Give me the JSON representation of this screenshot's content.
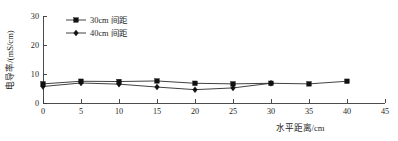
{
  "chart_data": {
    "type": "line",
    "title": "",
    "xlabel": "水平距离/cm",
    "ylabel": "电导率/(mS/cm)",
    "xlim": [
      0,
      45
    ],
    "ylim": [
      0,
      30
    ],
    "xticks": [
      0,
      5,
      10,
      15,
      20,
      25,
      30,
      35,
      40,
      45
    ],
    "yticks": [
      0,
      10,
      20,
      30
    ],
    "xtick_labels": [
      "0",
      "5",
      "10",
      "15",
      "20",
      "25",
      "30",
      "35",
      "40",
      "45"
    ],
    "ytick_labels": [
      "0",
      "10",
      "20",
      "30"
    ],
    "grid": false,
    "legend_position": "upper-left",
    "series": [
      {
        "name": "30cm 间距",
        "marker": "square",
        "color": "#111111",
        "x": [
          0,
          5,
          10,
          15,
          20,
          25,
          30,
          35,
          40
        ],
        "values": [
          6.6,
          7.5,
          7.4,
          7.6,
          6.8,
          6.6,
          6.8,
          6.6,
          7.5
        ]
      },
      {
        "name": "40cm 间距",
        "marker": "diamond",
        "color": "#111111",
        "x": [
          0,
          5,
          10,
          15,
          20,
          25,
          30
        ],
        "values": [
          5.7,
          6.9,
          6.5,
          5.5,
          4.6,
          5.2,
          6.8
        ]
      }
    ]
  },
  "legend": {
    "entries": [
      {
        "label": "30cm 间距",
        "marker": "square"
      },
      {
        "label": "40cm 间距",
        "marker": "diamond"
      }
    ]
  },
  "axes": {
    "x_title": "水平距离/cm",
    "y_title": "电导率/(mS/cm)"
  }
}
